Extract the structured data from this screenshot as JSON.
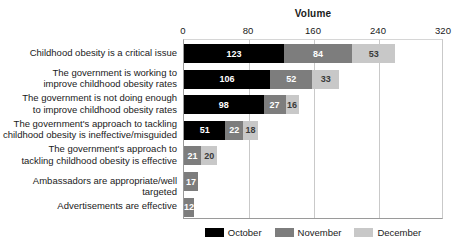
{
  "chart_data": {
    "type": "bar",
    "orientation": "horizontal",
    "stacked": true,
    "title": "Volume",
    "xlabel": "",
    "ylabel": "",
    "xlim": [
      0,
      320
    ],
    "xticks": [
      0,
      80,
      160,
      240,
      320
    ],
    "xtick_labels": [
      "0",
      "80",
      "160",
      "240",
      "320"
    ],
    "grid": true,
    "legend_position": "bottom",
    "categories": [
      "Childhood obesity is a critical issue",
      "The government is working to improve childhood obesity rates",
      "The government is not doing enough to improve childhood obesity rates",
      "The government's approach to tackling childhood obesity is ineffective/misguided",
      "The government's approach to tackling childhood obesity is effective",
      "Ambassadors are appropriate/well targeted",
      "Advertisements are effective"
    ],
    "category_lines": [
      [
        "Childhood obesity is a critical issue"
      ],
      [
        "The government is working to",
        "improve childhood obesity rates"
      ],
      [
        "The government is not doing enough",
        "to improve childhood obesity rates"
      ],
      [
        "The government's approach to tackling",
        "childhood obesity is ineffective/misguided"
      ],
      [
        "The government's approach to",
        "tackling childhood obesity is effective"
      ],
      [
        "Ambassadors are appropriate/well targeted"
      ],
      [
        "Advertisements are effective"
      ]
    ],
    "series": [
      {
        "name": "October",
        "color": "#000000",
        "values": [
          123,
          106,
          98,
          51,
          0,
          0,
          0
        ]
      },
      {
        "name": "November",
        "color": "#7d7d7d",
        "values": [
          84,
          52,
          27,
          22,
          21,
          17,
          12
        ]
      },
      {
        "name": "December",
        "color": "#c8c8c8",
        "values": [
          53,
          33,
          16,
          18,
          20,
          0,
          0
        ]
      }
    ]
  },
  "legend": {
    "items": [
      {
        "label": "October",
        "color": "#000000"
      },
      {
        "label": "November",
        "color": "#7d7d7d"
      },
      {
        "label": "December",
        "color": "#c8c8c8"
      }
    ]
  }
}
